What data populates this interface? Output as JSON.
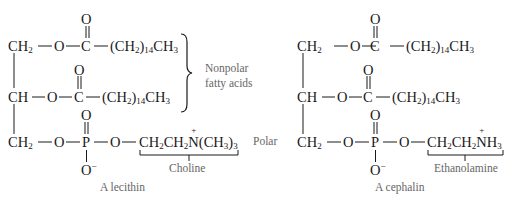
{
  "lecithin": {
    "name": "A lecithin",
    "row1": {
      "left": "CH",
      "left_sub": "2",
      "o": "O",
      "c": "C",
      "chain": "(CH",
      "chain_sub1": "2",
      "chain_mid": ")",
      "chain_sub2": "14",
      "chain_end": "CH",
      "chain_sub3": "3",
      "carbonyl": "O"
    },
    "row2": {
      "left": "CH",
      "o": "O",
      "c": "C",
      "chain": "(CH",
      "chain_sub1": "2",
      "chain_mid": ")",
      "chain_sub2": "14",
      "chain_end": "CH",
      "chain_sub3": "3",
      "carbonyl": "O"
    },
    "row3": {
      "left": "CH",
      "left_sub": "2",
      "o1": "O",
      "p": "P",
      "o2": "O",
      "head": "CH",
      "head_sub1": "2",
      "head2": "CH",
      "head_sub2": "2",
      "n": "N",
      "n_charge": "+",
      "methyl": "(CH",
      "methyl_sub1": "3",
      "methyl_close": ")",
      "methyl_sub2": "3",
      "phosphoryl": "O",
      "o_minus": "O",
      "o_minus_charge": "−"
    },
    "group_label": "Choline",
    "brace_label_line1": "Nonpolar",
    "brace_label_line2": "fatty acids",
    "polar_label": "Polar"
  },
  "cephalin": {
    "name": "A cephalin",
    "row1": {
      "left": "CH",
      "left_sub": "2",
      "o": "O",
      "c": "C",
      "chain": "(CH",
      "chain_sub1": "2",
      "chain_mid": ")",
      "chain_sub2": "14",
      "chain_end": "CH",
      "chain_sub3": "3",
      "carbonyl": "O"
    },
    "row2": {
      "left": "CH",
      "o": "O",
      "c": "C",
      "chain": "(CH",
      "chain_sub1": "2",
      "chain_mid": ")",
      "chain_sub2": "14",
      "chain_end": "CH",
      "chain_sub3": "3",
      "carbonyl": "O"
    },
    "row3": {
      "left": "CH",
      "left_sub": "2",
      "o1": "O",
      "p": "P",
      "o2": "O",
      "head": "CH",
      "head_sub1": "2",
      "head2": "CH",
      "head_sub2": "2",
      "n": "N",
      "n_charge": "+",
      "h": "H",
      "h_sub": "3",
      "phosphoryl": "O",
      "o_minus": "O",
      "o_minus_charge": "−"
    },
    "group_label": "Ethanolamine"
  }
}
